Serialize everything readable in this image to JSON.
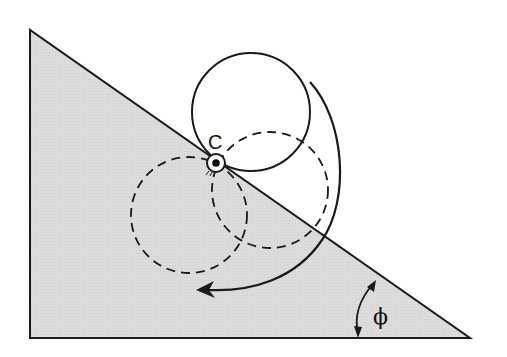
{
  "diagram": {
    "labels": {
      "pivot": "C",
      "angle": "ϕ"
    },
    "colors": {
      "incline_fill": "#d9d9d9",
      "stroke": "#1a1a1a",
      "background": "#ffffff"
    },
    "incline": {
      "points": [
        [
          30,
          30
        ],
        [
          30,
          338
        ],
        [
          470,
          338
        ]
      ]
    },
    "pivot_point": {
      "x": 216,
      "y": 163
    },
    "circles": [
      {
        "name": "solid-circle",
        "cx": 251,
        "cy": 112,
        "r": 59,
        "style": "solid"
      },
      {
        "name": "dashed-circle-right",
        "cx": 270,
        "cy": 190,
        "r": 58,
        "style": "dashed"
      },
      {
        "name": "dashed-circle-left",
        "cx": 189,
        "cy": 215,
        "r": 58,
        "style": "dashed"
      }
    ]
  }
}
